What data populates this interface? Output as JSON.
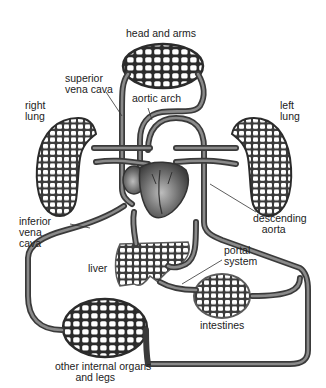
{
  "labels": {
    "head_arms": "head and arms",
    "superior_vena_cava": "superior\nvena cava",
    "aortic_arch": "aortic arch",
    "right_lung": "right\nlung",
    "left_lung": "left\nlung",
    "inferior_vena_cava": "inferior\nvena\ncava",
    "descending_aorta": "descending\n   aorta",
    "liver": "liver",
    "portal_system": "portal\nsystem",
    "intestines": "intestines",
    "other_organs": "other internal organs\n       and legs"
  },
  "colors": {
    "vessel": "#3a3a3a",
    "vessel_highlight": "#8a8a8a",
    "capillary_fill": "#2b2b2b",
    "heart": "#5a5a5a",
    "background": "#ffffff"
  }
}
